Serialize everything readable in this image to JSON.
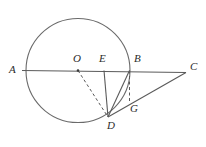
{
  "figure": {
    "kind": "euclidean-geometry-diagram",
    "width": 206,
    "height": 147,
    "background_color": "#ffffff",
    "stroke_color": "#555555",
    "label_color": "#2b2b2b",
    "dash_pattern": "3,2.5"
  },
  "circle": {
    "name": "main-circle",
    "center_x": 78,
    "center_y": 70.5,
    "radius": 52,
    "stroke_color": "#6a6a6a",
    "stroke_width": 1.1,
    "fill": "none"
  },
  "points": [
    {
      "id": "A",
      "label": "A",
      "x": 26,
      "y": 70.5,
      "label_x": 9,
      "label_y": 64,
      "on_circle": true,
      "marker": false
    },
    {
      "id": "O",
      "label": "O",
      "x": 78,
      "y": 70.5,
      "label_x": 73,
      "label_y": 54,
      "on_circle": false,
      "marker": true
    },
    {
      "id": "E",
      "label": "E",
      "x": 104,
      "y": 70.5,
      "label_x": 99,
      "label_y": 54,
      "on_circle": false,
      "marker": false
    },
    {
      "id": "B",
      "label": "B",
      "x": 129.5,
      "y": 70.5,
      "label_x": 135,
      "label_y": 54,
      "on_circle": true,
      "marker": false
    },
    {
      "id": "C",
      "label": "C",
      "x": 186,
      "y": 72.5,
      "label_x": 190,
      "label_y": 62,
      "on_circle": false,
      "marker": false
    },
    {
      "id": "D",
      "label": "D",
      "x": 108,
      "y": 117,
      "label_x": 108,
      "label_y": 120,
      "on_circle": true,
      "marker": false
    },
    {
      "id": "G",
      "label": "G",
      "x": 129.5,
      "y": 103.5,
      "label_x": 131,
      "label_y": 105,
      "on_circle": false,
      "marker": false
    }
  ],
  "segments": [
    {
      "name": "segment-AC",
      "from": "A",
      "to": "C",
      "style": "solid",
      "description": "horizontal line through A, O, E, B extending to C"
    },
    {
      "name": "segment-OD",
      "from": "O",
      "to": "D",
      "style": "dashed",
      "description": "radius from center O to D"
    },
    {
      "name": "segment-ED",
      "from": "E",
      "to": "D",
      "style": "solid",
      "description": "vertical-ish segment from E down to D"
    },
    {
      "name": "segment-BD",
      "from": "B",
      "to": "D",
      "style": "solid",
      "description": "chord from B to D"
    },
    {
      "name": "segment-GD",
      "from": "G",
      "to": "D",
      "style": "solid",
      "description": "part of line D to C passing through G"
    },
    {
      "name": "segment-DC",
      "from": "D",
      "to": "C",
      "style": "solid",
      "description": "line from D through G to C"
    },
    {
      "name": "segment-BG",
      "from": "B",
      "to": "G",
      "style": "dashed",
      "description": "dashed vertical from B down to G"
    }
  ],
  "labels": {
    "A": "A",
    "B": "B",
    "C": "C",
    "D": "D",
    "E": "E",
    "G": "G",
    "O": "O"
  }
}
